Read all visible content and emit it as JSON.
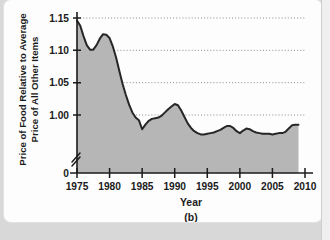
{
  "figure": {
    "caption": "(b)",
    "panel_label": "(b)"
  },
  "chart_data": {
    "type": "area",
    "title": "",
    "xlabel": "Year",
    "ylabel_line1": "Price of Food Relative to Average",
    "ylabel_line2": "Price of All Other Items",
    "xlim": [
      1974.2,
      2010.8
    ],
    "ylim": [
      0.955,
      1.158
    ],
    "y_axis_broken": true,
    "y_break_label": "0",
    "grid": true,
    "grid_axis": "y",
    "legend": null,
    "xticks": [
      1975,
      1980,
      1985,
      1990,
      1995,
      2000,
      2005,
      2010
    ],
    "xtick_labels": [
      "1975",
      "1980",
      "1985",
      "1990",
      "1995",
      "2000",
      "2005",
      "2010"
    ],
    "yticks": [
      1.0,
      1.05,
      1.1,
      1.15
    ],
    "ytick_labels": [
      "1.00",
      "1.05",
      "1.10",
      "1.15"
    ],
    "gridlines": [
      1.0,
      1.05,
      1.1,
      1.15
    ],
    "colors": {
      "area_fill": "#b6b6b6",
      "line": "#262626",
      "axis": "#1b1b1b",
      "grid": "#7d7d7d",
      "background": "#fdfdfd"
    },
    "x": [
      1975,
      1975.5,
      1976,
      1976.5,
      1977,
      1977.5,
      1978,
      1978.5,
      1979,
      1979.5,
      1980,
      1980.5,
      1981,
      1981.5,
      1982,
      1982.5,
      1983,
      1983.5,
      1984,
      1984.5,
      1985,
      1985.5,
      1986,
      1986.5,
      1987,
      1987.5,
      1988,
      1988.5,
      1989,
      1989.5,
      1990,
      1990.5,
      1991,
      1991.5,
      1992,
      1992.5,
      1993,
      1993.5,
      1994,
      1994.5,
      1995,
      1995.5,
      1996,
      1996.5,
      1997,
      1997.5,
      1998,
      1998.5,
      1999,
      1999.5,
      2000,
      2000.5,
      2001,
      2001.5,
      2002,
      2002.5,
      2003,
      2003.5,
      2004,
      2004.5,
      2005,
      2005.5,
      2006,
      2006.5,
      2007,
      2007.5,
      2008,
      2008.5,
      2009
    ],
    "values": [
      1.146,
      1.138,
      1.122,
      1.108,
      1.101,
      1.101,
      1.108,
      1.118,
      1.125,
      1.124,
      1.119,
      1.106,
      1.089,
      1.068,
      1.048,
      1.031,
      1.016,
      1.004,
      0.996,
      0.992,
      0.978,
      0.985,
      0.991,
      0.994,
      0.995,
      0.996,
      0.999,
      1.004,
      1.009,
      1.013,
      1.017,
      1.015,
      1.007,
      0.997,
      0.987,
      0.98,
      0.975,
      0.972,
      0.97,
      0.97,
      0.971,
      0.972,
      0.973,
      0.975,
      0.977,
      0.98,
      0.983,
      0.983,
      0.98,
      0.975,
      0.972,
      0.976,
      0.979,
      0.978,
      0.975,
      0.973,
      0.972,
      0.971,
      0.971,
      0.971,
      0.97,
      0.971,
      0.972,
      0.972,
      0.974,
      0.979,
      0.984,
      0.985,
      0.985
    ],
    "series_note": "Price of food relative to average price of all other items, 1975-2009"
  }
}
